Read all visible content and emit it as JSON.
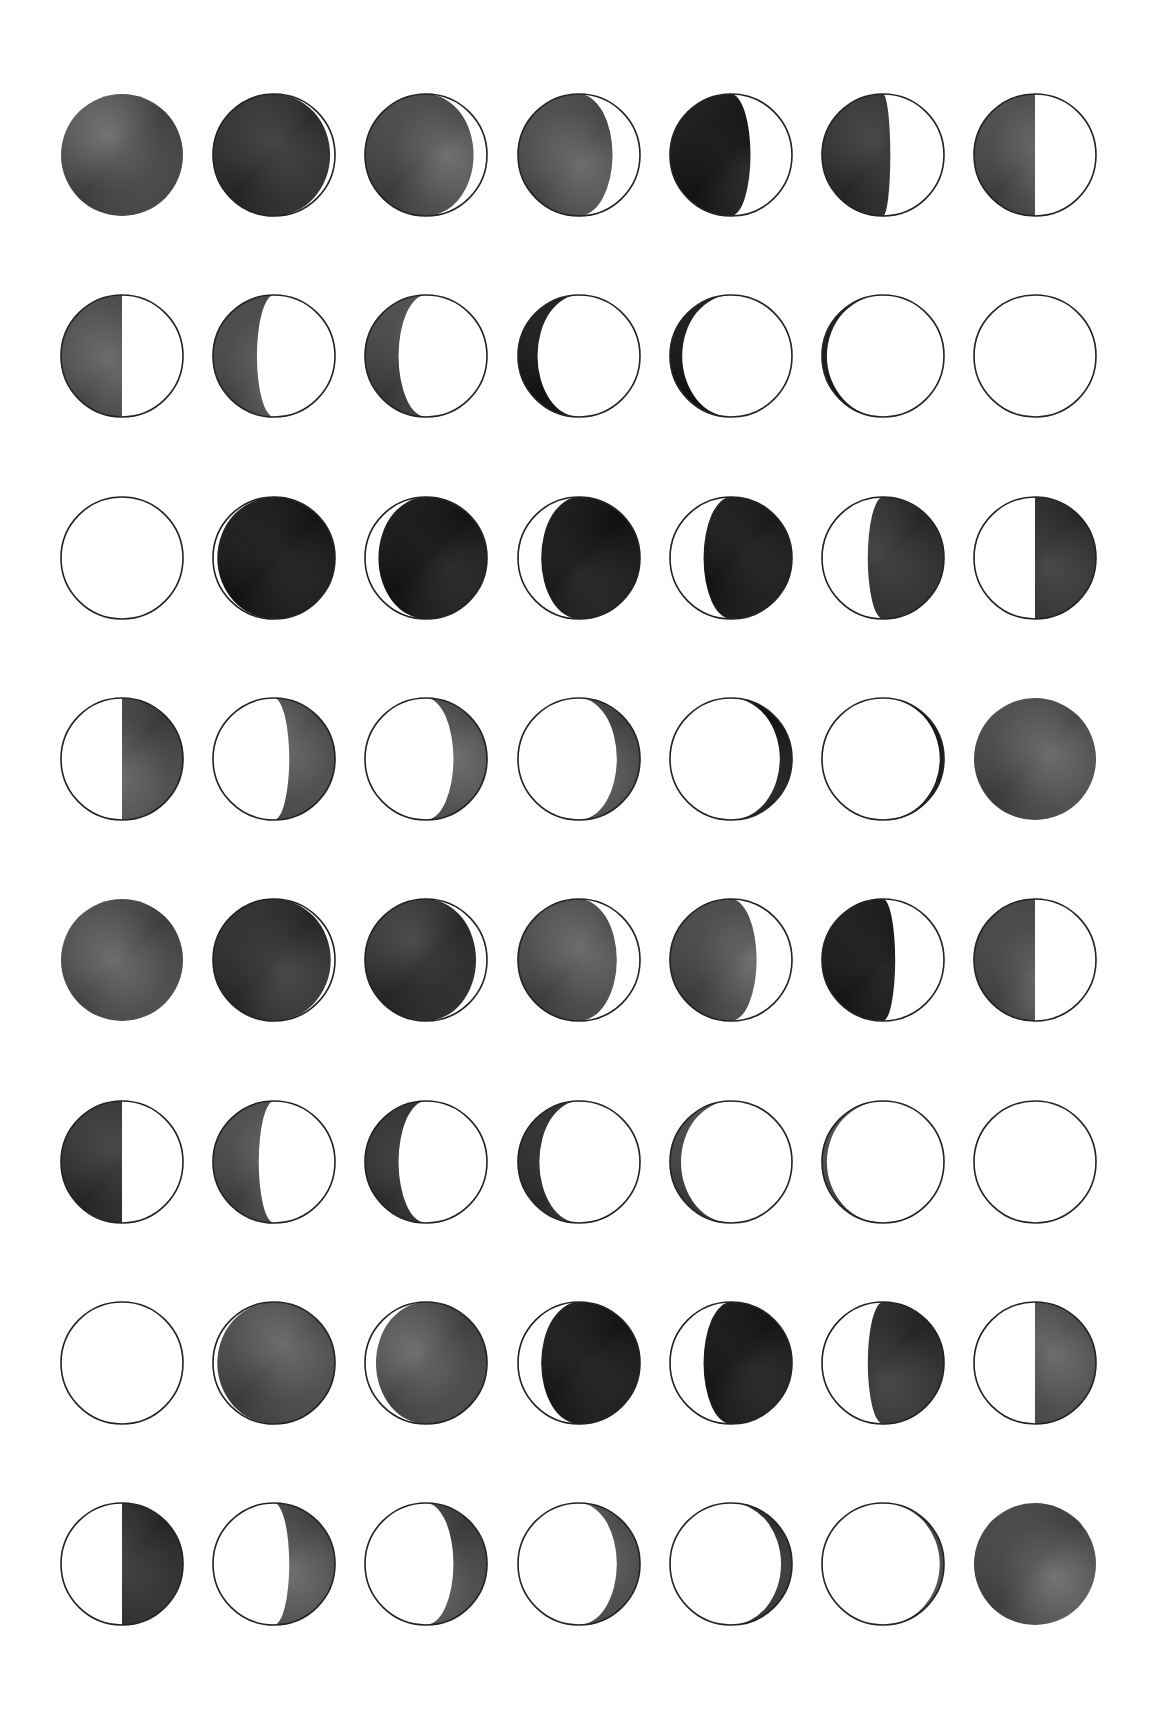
{
  "layout": {
    "cols": 7,
    "rows": 8,
    "x0": 122,
    "y0": 155,
    "dx": 152.2,
    "dy": 201.3,
    "radius": 61
  },
  "colors": {
    "background": "#ffffff",
    "outline": "#222222",
    "lit": "#ffffff",
    "shadow_dark": "#1a1a1a",
    "shadow_mid": "#4a4a4a",
    "shadow_light": "#7a7a7a"
  },
  "moons": [
    {
      "lit": "none",
      "k": 0,
      "tone": "mid"
    },
    {
      "lit": "right",
      "k": 0.92,
      "tone": "dark"
    },
    {
      "lit": "right",
      "k": 0.78,
      "tone": "mid"
    },
    {
      "lit": "right",
      "k": 0.55,
      "tone": "mid"
    },
    {
      "lit": "right",
      "k": 0.32,
      "tone": "black"
    },
    {
      "lit": "right",
      "k": 0.12,
      "tone": "dark"
    },
    {
      "lit": "right",
      "k": 0.0,
      "tone": "mid"
    },
    {
      "lit": "right",
      "k": 0.0,
      "tone": "mid"
    },
    {
      "lit": "right",
      "k": -0.28,
      "tone": "mid"
    },
    {
      "lit": "right",
      "k": -0.45,
      "tone": "mid"
    },
    {
      "lit": "right",
      "k": -0.68,
      "tone": "black"
    },
    {
      "lit": "right",
      "k": -0.8,
      "tone": "black"
    },
    {
      "lit": "right",
      "k": -0.92,
      "tone": "black"
    },
    {
      "lit": "all",
      "k": 0,
      "tone": "none"
    },
    {
      "lit": "all",
      "k": 0,
      "tone": "none"
    },
    {
      "lit": "left",
      "k": -0.93,
      "tone": "black"
    },
    {
      "lit": "left",
      "k": -0.78,
      "tone": "black"
    },
    {
      "lit": "left",
      "k": -0.62,
      "tone": "black"
    },
    {
      "lit": "left",
      "k": -0.45,
      "tone": "black"
    },
    {
      "lit": "left",
      "k": -0.25,
      "tone": "dark"
    },
    {
      "lit": "left",
      "k": 0.0,
      "tone": "dark"
    },
    {
      "lit": "left",
      "k": 0.0,
      "tone": "mid"
    },
    {
      "lit": "left",
      "k": 0.25,
      "tone": "mid"
    },
    {
      "lit": "left",
      "k": 0.45,
      "tone": "mid"
    },
    {
      "lit": "left",
      "k": 0.62,
      "tone": "mid"
    },
    {
      "lit": "left",
      "k": 0.8,
      "tone": "black"
    },
    {
      "lit": "left",
      "k": 0.93,
      "tone": "black"
    },
    {
      "lit": "none",
      "k": 0,
      "tone": "mid"
    },
    {
      "lit": "none",
      "k": 0,
      "tone": "mid"
    },
    {
      "lit": "right",
      "k": 0.93,
      "tone": "dark"
    },
    {
      "lit": "right",
      "k": 0.82,
      "tone": "dark"
    },
    {
      "lit": "right",
      "k": 0.62,
      "tone": "mid"
    },
    {
      "lit": "right",
      "k": 0.42,
      "tone": "mid"
    },
    {
      "lit": "right",
      "k": 0.2,
      "tone": "black"
    },
    {
      "lit": "right",
      "k": 0.0,
      "tone": "mid"
    },
    {
      "lit": "right",
      "k": 0.0,
      "tone": "dark"
    },
    {
      "lit": "right",
      "k": -0.25,
      "tone": "mid"
    },
    {
      "lit": "right",
      "k": -0.45,
      "tone": "dark"
    },
    {
      "lit": "right",
      "k": -0.65,
      "tone": "dark"
    },
    {
      "lit": "right",
      "k": -0.82,
      "tone": "mid"
    },
    {
      "lit": "right",
      "k": -0.92,
      "tone": "mid"
    },
    {
      "lit": "all",
      "k": 0,
      "tone": "none"
    },
    {
      "lit": "all",
      "k": 0,
      "tone": "none"
    },
    {
      "lit": "left",
      "k": -0.93,
      "tone": "mid"
    },
    {
      "lit": "left",
      "k": -0.82,
      "tone": "mid"
    },
    {
      "lit": "left",
      "k": -0.62,
      "tone": "black"
    },
    {
      "lit": "left",
      "k": -0.45,
      "tone": "black"
    },
    {
      "lit": "left",
      "k": -0.25,
      "tone": "dark"
    },
    {
      "lit": "left",
      "k": 0.0,
      "tone": "mid"
    },
    {
      "lit": "left",
      "k": 0.0,
      "tone": "dark"
    },
    {
      "lit": "left",
      "k": 0.25,
      "tone": "mid"
    },
    {
      "lit": "left",
      "k": 0.45,
      "tone": "mid"
    },
    {
      "lit": "left",
      "k": 0.62,
      "tone": "mid"
    },
    {
      "lit": "left",
      "k": 0.82,
      "tone": "dark"
    },
    {
      "lit": "left",
      "k": 0.93,
      "tone": "mid"
    },
    {
      "lit": "none",
      "k": 0,
      "tone": "mid"
    }
  ]
}
